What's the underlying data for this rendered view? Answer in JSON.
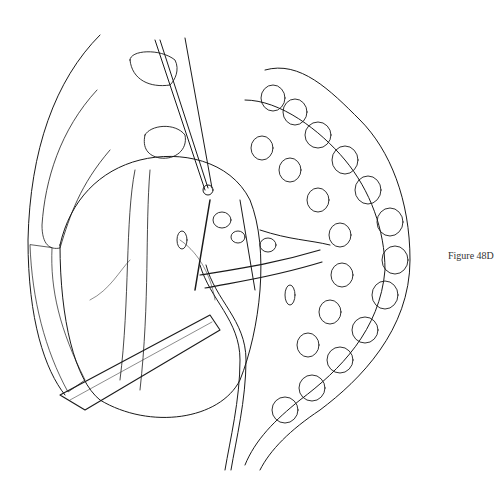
{
  "figure": {
    "caption": "Figure 48D",
    "colors": {
      "ink": "#1a1a1a",
      "paper": "#ffffff",
      "caption": "#333333"
    }
  }
}
